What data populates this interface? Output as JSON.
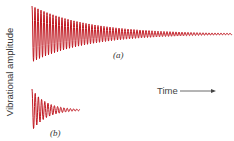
{
  "chart_data": {
    "type": "line",
    "title": "",
    "xlabel": "Time",
    "ylabel": "Vibrational amplitude",
    "grid": false,
    "legend": null,
    "color": "#c0161f",
    "series": [
      {
        "name": "(a)",
        "label": "(a)",
        "description": "Lightly damped oscillation, slow exponential decay",
        "x_start": 32,
        "x_end": 232,
        "center_y": 34,
        "initial_half_amplitude": 28,
        "decay_rate": 0.018,
        "period": 3.0
      },
      {
        "name": "(b)",
        "label": "(b)",
        "description": "Heavily damped oscillation, fast exponential decay",
        "x_start": 32,
        "x_end": 80,
        "center_y": 110,
        "initial_half_amplitude": 21,
        "decay_rate": 0.07,
        "period": 3.2
      }
    ]
  },
  "labels": {
    "y_axis": "Vibrational amplitude",
    "x_axis": "Time",
    "panel_a": "(a)",
    "panel_b": "(b)"
  }
}
